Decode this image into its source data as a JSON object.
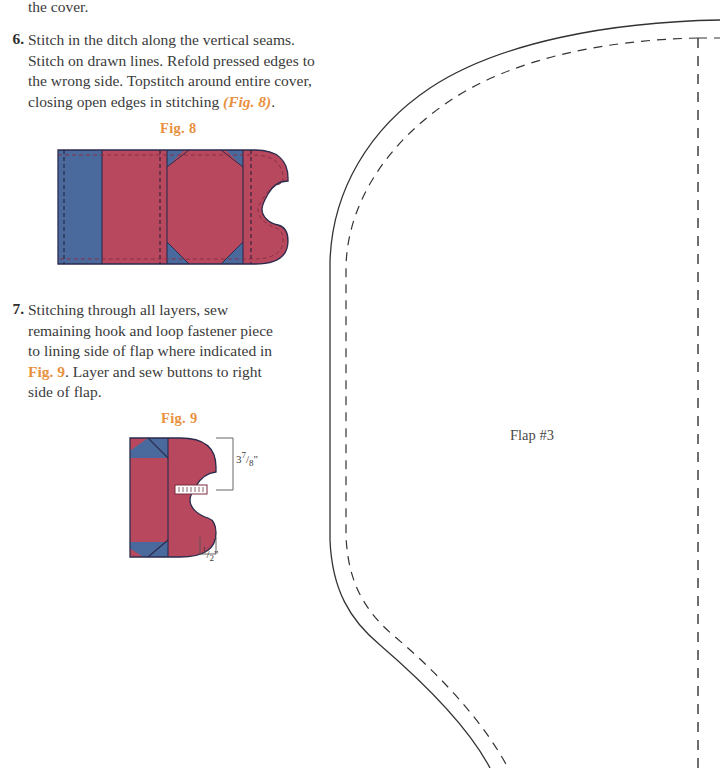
{
  "document": {
    "type": "sewing-pattern-instruction-page",
    "continued_text": "the cover."
  },
  "colors": {
    "fabric_main": "#b8485e",
    "fabric_accent": "#4a6a9e",
    "fig_caption": "#e8913f",
    "line": "#333333",
    "text": "#3a3a3a",
    "page_background": "#ffffff"
  },
  "steps": [
    {
      "number": "6.",
      "text_before": "Stitch in the ditch along the vertical seams. Stitch on drawn lines. Refold pressed edges to the wrong side. Topstitch around entire cover, closing open edges in stitching ",
      "figref": "(Fig. 8)",
      "text_after": "."
    },
    {
      "number": "7.",
      "text_before": "Stitching through all layers, sew remaining hook and loop fastener piece to lining side of flap where indicated in ",
      "figref": "Fig. 9",
      "text_after": ". Layer and sew buttons to right side of flap."
    }
  ],
  "figures": [
    {
      "caption": "Fig. 8",
      "name": "cover-assembly-diagram",
      "description": "Flat rectangular cover with rounded right end and notch, divided into panels with blue accent corner triangles and dashed stitch lines."
    },
    {
      "caption": "Fig. 9",
      "name": "flap-fastener-diagram",
      "description": "Flap piece showing hook and loop fastener placement with two dimension callouts.",
      "dimensions": [
        {
          "name": "fastener-from-top",
          "value": "3",
          "numerator": "7",
          "denominator": "8",
          "unit": "\""
        },
        {
          "name": "fastener-from-edge",
          "value": "",
          "numerator": "1",
          "denominator": "2",
          "unit": "\""
        }
      ]
    }
  ],
  "pattern_piece": {
    "label": "Flap #3",
    "cutting_line_style": "solid",
    "seam_line_style": "dashed"
  }
}
